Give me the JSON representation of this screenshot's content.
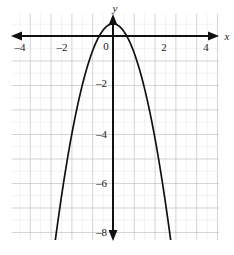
{
  "figure": {
    "background_color": "#ffffff",
    "grid_color_minor": "#d8d8dc",
    "grid_color_major": "#a9a9ae",
    "axis_color": "#111111",
    "curve_color": "#111111"
  },
  "labels": {
    "x_axis_name": "x",
    "y_axis_name": "y",
    "origin": "0"
  },
  "chart_data": {
    "type": "line",
    "title": "",
    "xlabel": "x",
    "ylabel": "y",
    "grid": true,
    "legend": null,
    "xlim": [
      -4.9,
      5.1
    ],
    "ylim": [
      -9.2,
      0.9
    ],
    "xticks": [
      -4,
      -2,
      2,
      4
    ],
    "xtick_labels": [
      "–4",
      "–2",
      "2",
      "4"
    ],
    "yticks": [
      -2,
      -4,
      -6,
      -8
    ],
    "ytick_labels": [
      "–2",
      "–4",
      "–6",
      "–8"
    ],
    "x_minor_step": 0.5,
    "y_minor_step": 0.5,
    "series": [
      {
        "name": "parabola",
        "shape": "downward-opening parabola",
        "equation": "y = -1.15x^2 + 0.5",
        "vertex": [
          0,
          0.5
        ],
        "x_intercepts": [
          -0.66,
          0.66
        ],
        "y_intercept": 0.5,
        "x": [
          -2.72,
          -2.5,
          -2.25,
          -2.0,
          -1.75,
          -1.5,
          -1.25,
          -1.0,
          -0.75,
          -0.5,
          -0.25,
          0,
          0.25,
          0.5,
          0.75,
          1.0,
          1.25,
          1.5,
          1.75,
          2.0,
          2.25,
          2.5,
          2.72
        ],
        "y": [
          -8.0,
          -6.69,
          -5.32,
          -4.1,
          -3.02,
          -2.09,
          -1.3,
          -0.65,
          -0.15,
          0.21,
          0.43,
          0.5,
          0.43,
          0.21,
          -0.15,
          -0.65,
          -1.3,
          -2.09,
          -3.02,
          -4.1,
          -5.32,
          -6.69,
          -8.0
        ]
      }
    ]
  }
}
